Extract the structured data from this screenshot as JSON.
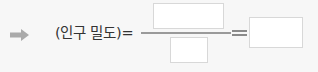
{
  "arrow": {
    "icon": "right-arrow-icon",
    "color": "#aaaaaa"
  },
  "formula": {
    "label": "(인구 밀도)=",
    "numerator_value": "",
    "denominator_value": "",
    "result_value": ""
  },
  "colors": {
    "text": "#333333",
    "line": "#9a9a9a",
    "box_border": "#d8d8d8",
    "background": "#f7f7f7"
  }
}
